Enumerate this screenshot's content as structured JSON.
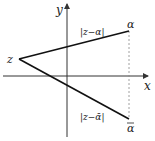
{
  "diagram": {
    "axes": {
      "x_label": "x",
      "y_label": "y"
    },
    "points": {
      "z": {
        "label": "z"
      },
      "alpha": {
        "label": "α"
      },
      "alpha_conj": {
        "label": "α"
      }
    },
    "segments": {
      "upper": {
        "label": "|z−α|"
      },
      "lower": {
        "label": "|z−ᾱ|"
      }
    },
    "colors": {
      "line": "#111111",
      "axis": "#333333",
      "dashed": "#888888"
    }
  }
}
